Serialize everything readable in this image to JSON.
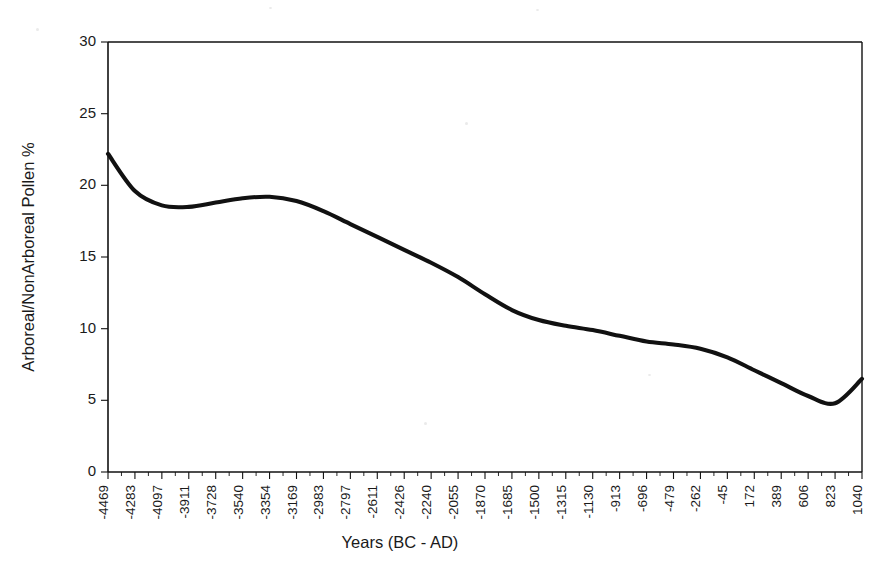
{
  "chart_data": {
    "type": "line",
    "title": "",
    "xlabel": "Years (BC - AD)",
    "ylabel": "Arboreal/NonArboreal Pollen %",
    "xlim": [
      -4469,
      1040
    ],
    "ylim": [
      0,
      30
    ],
    "grid": false,
    "legend": "none",
    "y_ticks": [
      0,
      5,
      10,
      15,
      20,
      25,
      30
    ],
    "x_tick_labels": [
      "-4469",
      "-4283",
      "-4097",
      "-3911",
      "-3728",
      "-3540",
      "-3354",
      "-3169",
      "-2983",
      "-2797",
      "-2611",
      "-2426",
      "-2240",
      "-2055",
      "-1870",
      "-1685",
      "-1500",
      "-1315",
      "-1130",
      "-913",
      "-696",
      "-479",
      "-262",
      "-45",
      "172",
      "389",
      "606",
      "823",
      "1040"
    ],
    "x": [
      -4469,
      -4283,
      -4097,
      -3911,
      -3728,
      -3540,
      -3354,
      -3169,
      -2983,
      -2797,
      -2611,
      -2426,
      -2240,
      -2055,
      -1870,
      -1685,
      -1500,
      -1315,
      -1130,
      -913,
      -696,
      -479,
      -262,
      -45,
      172,
      389,
      606,
      823,
      1040
    ],
    "series": [
      {
        "name": "Arboreal/NonArboreal Pollen %",
        "color": "#111111",
        "values": [
          22.2,
          19.6,
          18.6,
          18.5,
          18.8,
          19.1,
          19.2,
          18.9,
          18.2,
          17.3,
          16.4,
          15.5,
          14.6,
          13.6,
          12.4,
          11.3,
          10.6,
          10.2,
          9.9,
          9.5,
          9.1,
          8.9,
          8.6,
          8.0,
          7.1,
          6.2,
          5.3,
          4.8,
          6.5
        ]
      }
    ],
    "annotations": [],
    "notes": {
      "start_value": 22.2,
      "first_minimum": 18.5,
      "local_maximum": 19.2,
      "global_minimum": 4.8,
      "end_value": 6.5
    }
  },
  "figure": {
    "background_color": "#ffffff",
    "axis_color": "#111111",
    "curve_color": "#111111"
  }
}
